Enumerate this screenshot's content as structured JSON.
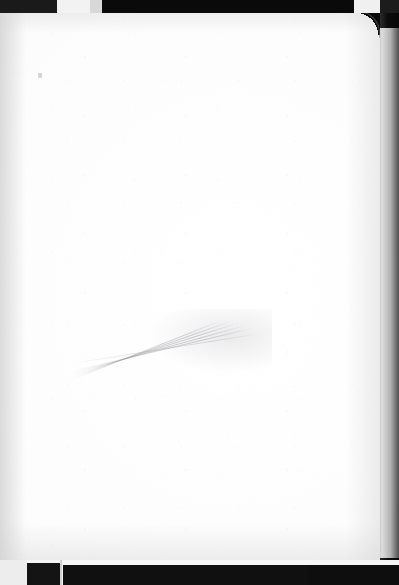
{
  "document": {
    "type": "scanned-document",
    "subject": "blank ruled notebook paper",
    "title": "",
    "body_text": "",
    "page_number": "",
    "handwriting": "",
    "printed_text": ""
  },
  "paper": {
    "description": "blank lined notebook sheet, no writing",
    "paper_color": "#fdfdfd",
    "rule_color": "#969aa0",
    "rule_style": "dotted",
    "rule_count": 24,
    "rule_spacing_px": 23,
    "first_rule_y_px": 22,
    "rule_positions_px": [
      22,
      45,
      68,
      91,
      114,
      137,
      160,
      183,
      206,
      229,
      252,
      275,
      298,
      321,
      344,
      367,
      390,
      413,
      436,
      459,
      482,
      505,
      528,
      545
    ],
    "corner_radius_px": 22,
    "rounded_corner": "top-right",
    "sheet_left_px": 0,
    "sheet_top_px": 11,
    "sheet_width_px": 380,
    "sheet_height_px": 552
  },
  "marks": {
    "smudge": {
      "label": "pencil-smudge-crease",
      "description": "faint fanned crease lines radiating toward upper right",
      "x_px": 72,
      "y_px": 292,
      "width_px": 200,
      "height_px": 82,
      "color": "#949498"
    },
    "pencil_tick": {
      "label": "faint-pencil-tick",
      "x_px": 38,
      "y_px": 62,
      "color": "#a5a5ac"
    }
  },
  "background": {
    "color": "#0b0b0b",
    "top_band_height_px": 13,
    "bottom_band_height_px": 25,
    "right_strip_width_px": 19,
    "segments_top": [
      {
        "name": "dark-left",
        "x": 0,
        "w": 57,
        "color": "#1a1a1a"
      },
      {
        "name": "white-lid-1",
        "x": 57,
        "w": 33,
        "color": "#f2f2f2"
      },
      {
        "name": "gray-step",
        "x": 90,
        "w": 12,
        "color": "#d8d8d8"
      },
      {
        "name": "dark-center",
        "x": 102,
        "w": 252,
        "color": "#0a0a0a"
      },
      {
        "name": "white-lid-2",
        "x": 354,
        "w": 26,
        "color": "#f0f0f0"
      },
      {
        "name": "dark-right",
        "x": 380,
        "w": 19,
        "color": "#1c1c1c"
      }
    ],
    "segments_bottom": [
      {
        "name": "light-left",
        "x": 0,
        "w": 27,
        "color": "#ededed"
      },
      {
        "name": "dark-block-1",
        "x": 27,
        "w": 33,
        "color": "#141414"
      },
      {
        "name": "dark-block-2",
        "x": 63,
        "w": 245,
        "color": "#101010"
      },
      {
        "name": "dark-block-3",
        "x": 308,
        "w": 91,
        "color": "#0e0e0e"
      }
    ]
  }
}
